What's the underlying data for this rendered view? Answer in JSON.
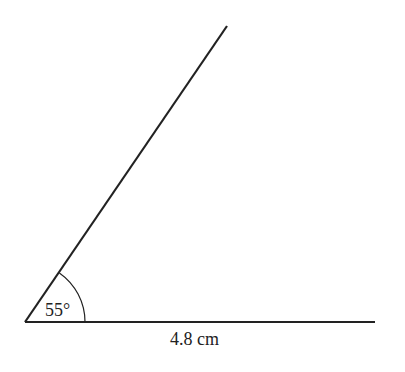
{
  "diagram": {
    "type": "angle",
    "angle_label": "55°",
    "angle_degrees": 55,
    "base_length_label": "4.8 cm",
    "colors": {
      "line": "#222222",
      "background": "#ffffff"
    }
  }
}
